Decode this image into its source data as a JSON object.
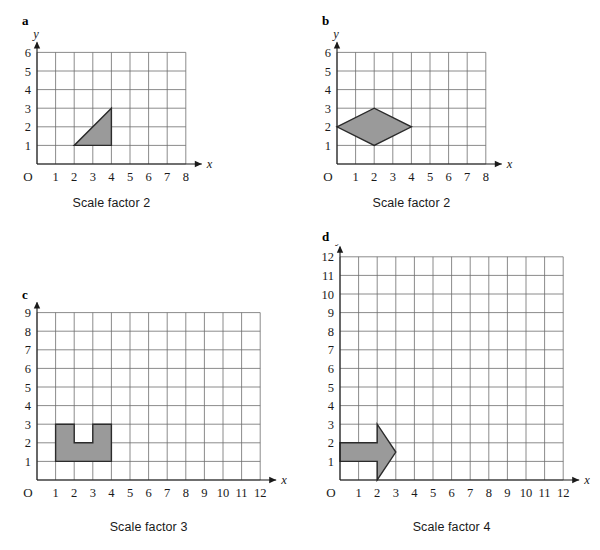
{
  "figure": {
    "title": "",
    "background": "#ffffff",
    "shape_fill": "#9a9a9a",
    "shape_stroke": "#2b2b2b",
    "grid_color": "#6d6d6d",
    "axis_color": "#1a1a1a"
  },
  "chart_data": [
    {
      "type": "scatter",
      "panel": "a",
      "label": "a",
      "caption": "Scale factor 2",
      "xlabel": "x",
      "ylabel": "y",
      "origin_label": "O",
      "xlim": [
        0,
        8
      ],
      "ylim": [
        0,
        6
      ],
      "xticks": [
        1,
        2,
        3,
        4,
        5,
        6,
        7,
        8
      ],
      "yticks": [
        1,
        2,
        3,
        4,
        5,
        6
      ],
      "grid": true,
      "shape_name": "right-triangle",
      "vertices": [
        [
          2,
          1
        ],
        [
          4,
          1
        ],
        [
          4,
          3
        ]
      ]
    },
    {
      "type": "scatter",
      "panel": "b",
      "label": "b",
      "caption": "Scale factor 2",
      "xlabel": "x",
      "ylabel": "y",
      "origin_label": "O",
      "xlim": [
        0,
        8
      ],
      "ylim": [
        0,
        6
      ],
      "xticks": [
        1,
        2,
        3,
        4,
        5,
        6,
        7,
        8
      ],
      "yticks": [
        1,
        2,
        3,
        4,
        5,
        6
      ],
      "grid": true,
      "shape_name": "rhombus",
      "vertices": [
        [
          0,
          2
        ],
        [
          2,
          3
        ],
        [
          4,
          2
        ],
        [
          2,
          1
        ]
      ]
    },
    {
      "type": "scatter",
      "panel": "c",
      "label": "c",
      "caption": "Scale factor 3",
      "xlabel": "x",
      "ylabel": "y",
      "origin_label": "O",
      "xlim": [
        0,
        12
      ],
      "ylim": [
        0,
        9
      ],
      "xticks": [
        1,
        2,
        3,
        4,
        5,
        6,
        7,
        8,
        9,
        10,
        11,
        12
      ],
      "yticks": [
        1,
        2,
        3,
        4,
        5,
        6,
        7,
        8,
        9
      ],
      "grid": true,
      "shape_name": "u-shape",
      "vertices": [
        [
          1,
          1
        ],
        [
          4,
          1
        ],
        [
          4,
          3
        ],
        [
          3,
          3
        ],
        [
          3,
          2
        ],
        [
          2,
          2
        ],
        [
          2,
          3
        ],
        [
          1,
          3
        ]
      ]
    },
    {
      "type": "scatter",
      "panel": "d",
      "label": "d",
      "caption": "Scale factor 4",
      "xlabel": "x",
      "ylabel": "y",
      "origin_label": "O",
      "xlim": [
        0,
        12
      ],
      "ylim": [
        0,
        12
      ],
      "xticks": [
        1,
        2,
        3,
        4,
        5,
        6,
        7,
        8,
        9,
        10,
        11,
        12
      ],
      "yticks": [
        1,
        2,
        3,
        4,
        5,
        6,
        7,
        8,
        9,
        10,
        11,
        12
      ],
      "grid": true,
      "shape_name": "arrow",
      "vertices": [
        [
          0,
          1
        ],
        [
          2,
          1
        ],
        [
          2,
          0
        ],
        [
          3,
          1.5
        ],
        [
          2,
          3
        ],
        [
          2,
          2
        ],
        [
          0,
          2
        ]
      ]
    }
  ]
}
